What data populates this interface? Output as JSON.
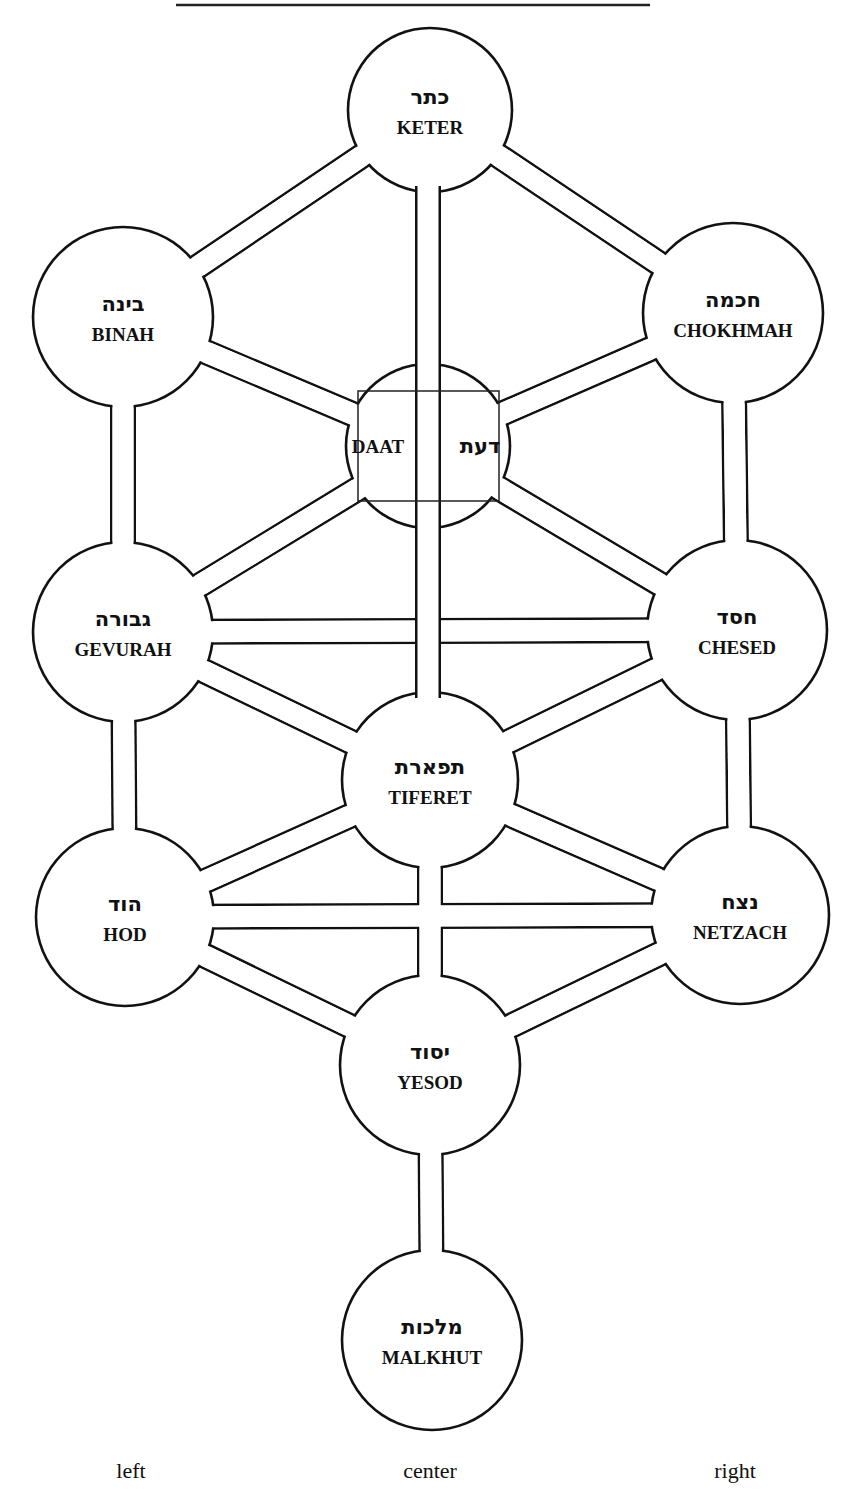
{
  "diagram": {
    "type": "tree-of-life",
    "line_color": "#111111",
    "background": "#ffffff",
    "top_rule": {
      "x1": 176,
      "x2": 650,
      "y": 5
    },
    "sefirot": [
      {
        "id": "keter",
        "hebrew": "כתר",
        "name": "KETER",
        "cx": 430,
        "cy": 110,
        "r": 82
      },
      {
        "id": "binah",
        "hebrew": "בינה",
        "name": "BINAH",
        "cx": 123,
        "cy": 317,
        "r": 90
      },
      {
        "id": "chokhmah",
        "hebrew": "חכמה",
        "name": "CHOKHMAH",
        "cx": 733,
        "cy": 313,
        "r": 90
      },
      {
        "id": "daat",
        "hebrew": "דעת",
        "name": "DAAT",
        "cx": 428,
        "cy": 446,
        "r": 82
      },
      {
        "id": "gevurah",
        "hebrew": "גבורה",
        "name": "GEVURAH",
        "cx": 123,
        "cy": 632,
        "r": 90
      },
      {
        "id": "chesed",
        "hebrew": "חסד",
        "name": "CHESED",
        "cx": 737,
        "cy": 630,
        "r": 90
      },
      {
        "id": "tiferet",
        "hebrew": "תפארת",
        "name": "TIFERET",
        "cx": 430,
        "cy": 780,
        "r": 88
      },
      {
        "id": "hod",
        "hebrew": "הוד",
        "name": "HOD",
        "cx": 125,
        "cy": 917,
        "r": 89
      },
      {
        "id": "netzach",
        "hebrew": "נצח",
        "name": "NETZACH",
        "cx": 740,
        "cy": 915,
        "r": 89
      },
      {
        "id": "yesod",
        "hebrew": "יסוד",
        "name": "YESOD",
        "cx": 430,
        "cy": 1065,
        "r": 90
      },
      {
        "id": "malkhut",
        "hebrew": "מלכות",
        "name": "MALKHUT",
        "cx": 432,
        "cy": 1340,
        "r": 90
      }
    ],
    "paths": [
      [
        "keter",
        "binah"
      ],
      [
        "keter",
        "chokhmah"
      ],
      [
        "binah",
        "daat"
      ],
      [
        "chokhmah",
        "daat"
      ],
      [
        "daat",
        "gevurah"
      ],
      [
        "daat",
        "chesed"
      ],
      [
        "binah",
        "gevurah"
      ],
      [
        "chokhmah",
        "chesed"
      ],
      [
        "gevurah",
        "chesed"
      ],
      [
        "gevurah",
        "tiferet"
      ],
      [
        "chesed",
        "tiferet"
      ],
      [
        "gevurah",
        "hod"
      ],
      [
        "chesed",
        "netzach"
      ],
      [
        "tiferet",
        "hod"
      ],
      [
        "tiferet",
        "netzach"
      ],
      [
        "hod",
        "netzach"
      ],
      [
        "hod",
        "yesod"
      ],
      [
        "netzach",
        "yesod"
      ],
      [
        "tiferet",
        "yesod"
      ],
      [
        "yesod",
        "malkhut"
      ],
      [
        "keter",
        "tiferet"
      ]
    ],
    "pillars": [
      {
        "label": "left",
        "x": 131
      },
      {
        "label": "center",
        "x": 430
      },
      {
        "label": "right",
        "x": 735
      }
    ]
  }
}
